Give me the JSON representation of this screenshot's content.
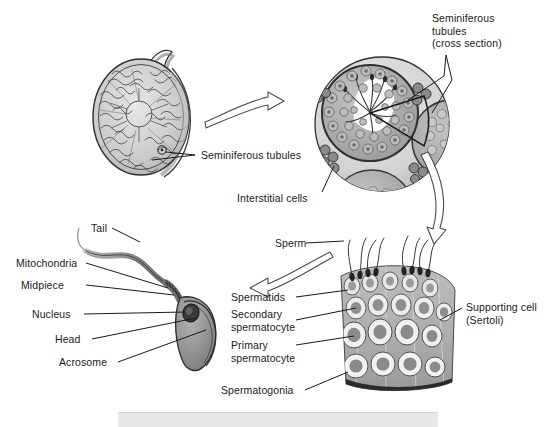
{
  "figure": {
    "background_color": "#ffffff",
    "ink_color": "#1a1a1a",
    "tone_light": "#d9d9d9",
    "tone_mid": "#a8a8a8",
    "tone_dark": "#6f6f6f",
    "tone_darkest": "#3c3c3c"
  },
  "labels": {
    "seminiferous_tubules_cross_section": "Seminiferous\ntubules\n(cross section)",
    "seminiferous_tubules": "Seminiferous tubules",
    "interstitial_cells": "Interstitial cells",
    "tail": "Tail",
    "mitochondria": "Mitochondria",
    "midpiece": "Midpiece",
    "nucleus": "Nucleus",
    "head": "Head",
    "acrosome": "Acrosome",
    "sperm": "Sperm",
    "spermatids": "Spermatids",
    "secondary_spermatocyte": "Secondary\nspermatocyte",
    "primary_spermatocyte": "Primary\nspermatocyte",
    "spermatogonia": "Spermatogonia",
    "supporting_cell_sertoli": "Supporting cell\n(Sertoli)"
  },
  "panels": {
    "testis_whole": "whole-testis-sagittal-view",
    "tubule_cross_section": "seminiferous-tubule-cross-section",
    "tubule_wedge": "seminiferous-tubule-wall-wedge",
    "sperm_cell": "mature-sperm-cell-detail"
  },
  "arrows": {
    "testis_to_cross_section": "curved-arrow-right",
    "cross_section_to_wedge": "curved-arrow-down",
    "wedge_to_sperm": "curved-arrow-left"
  }
}
